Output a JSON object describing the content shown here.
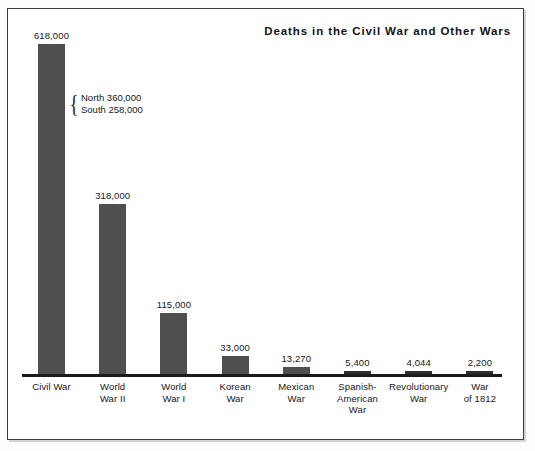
{
  "chart_data": {
    "type": "bar",
    "title": "Deaths in the Civil War and Other Wars",
    "xlabel": "",
    "ylabel": "",
    "grid": false,
    "legend": "none",
    "ylim": [
      0,
      618000
    ],
    "categories": [
      "Civil War",
      "World War II",
      "World War I",
      "Korean War",
      "Mexican War",
      "Spanish-American War",
      "Revolutionary War",
      "War of 1812"
    ],
    "category_lines": [
      [
        "Civil War"
      ],
      [
        "World",
        "War II"
      ],
      [
        "World",
        "War I"
      ],
      [
        "Korean",
        "War"
      ],
      [
        "Mexican",
        "War"
      ],
      [
        "Spanish-",
        "American",
        "War"
      ],
      [
        "Revolutionary",
        "War"
      ],
      [
        "War",
        "of 1812"
      ]
    ],
    "values": [
      618000,
      318000,
      115000,
      33000,
      13270,
      5400,
      4044,
      2200
    ],
    "value_labels": [
      "618,000",
      "318,000",
      "115,000",
      "33,000",
      "13,270",
      "5,400",
      "4,044",
      "2,200"
    ],
    "annotations": [
      {
        "target": "Civil War",
        "brace": "{",
        "lines": [
          "North 360,000",
          "South 258,000"
        ]
      }
    ],
    "bar_color": "#4f4f4f",
    "axis_color": "#1b1b1b",
    "background": "#ffffff",
    "frame_color": "#3a3a3a"
  }
}
